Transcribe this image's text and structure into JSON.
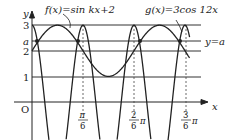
{
  "diagram": {
    "f_label": "f(x)=sin kx+2",
    "g_label": "g(x)=3cos 12x",
    "line_label": "y=a",
    "axis_x": "x",
    "axis_y": "y",
    "origin": "O",
    "y_ticks": [
      "3",
      "a",
      "2",
      "1"
    ],
    "x_ticks": [
      {
        "num": "π",
        "den": "6",
        "suffix": ""
      },
      {
        "num": "2",
        "den": "6",
        "suffix": "π"
      },
      {
        "num": "3",
        "den": "6",
        "suffix": "π"
      }
    ],
    "colors": {
      "stroke": "#222222",
      "background": "#ffffff"
    }
  }
}
